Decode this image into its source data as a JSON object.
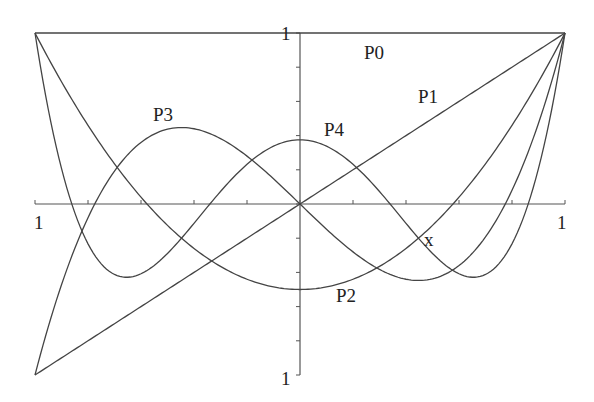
{
  "chart_data": {
    "type": "line",
    "title": "",
    "xlabel": "x",
    "ylabel": "",
    "xlim": [
      -1,
      1
    ],
    "ylim": [
      -1,
      1
    ],
    "grid": false,
    "legend": "inline labels",
    "x_tick_labels": [
      {
        "x": -1,
        "text": "1"
      },
      {
        "x": 1,
        "text": "1"
      }
    ],
    "y_tick_labels": [
      {
        "y": 1,
        "text": "1"
      },
      {
        "y": -1,
        "text": "1"
      }
    ],
    "x_ticks": [
      -1,
      -0.8,
      -0.6,
      -0.4,
      -0.2,
      0,
      0.2,
      0.4,
      0.6,
      0.8,
      1
    ],
    "y_ticks": [
      -1,
      -0.8,
      -0.6,
      -0.4,
      -0.2,
      0,
      0.2,
      0.4,
      0.6,
      0.8,
      1
    ],
    "x": [
      -1,
      -0.9,
      -0.8,
      -0.7,
      -0.6,
      -0.5,
      -0.4,
      -0.3,
      -0.2,
      -0.1,
      0,
      0.1,
      0.2,
      0.3,
      0.4,
      0.5,
      0.6,
      0.7,
      0.8,
      0.9,
      1
    ],
    "series": [
      {
        "name": "P0",
        "formula": "1",
        "values": [
          1,
          1,
          1,
          1,
          1,
          1,
          1,
          1,
          1,
          1,
          1,
          1,
          1,
          1,
          1,
          1,
          1,
          1,
          1,
          1,
          1
        ]
      },
      {
        "name": "P1",
        "formula": "x",
        "values": [
          -1,
          -0.9,
          -0.8,
          -0.7,
          -0.6,
          -0.5,
          -0.4,
          -0.3,
          -0.2,
          -0.1,
          0,
          0.1,
          0.2,
          0.3,
          0.4,
          0.5,
          0.6,
          0.7,
          0.8,
          0.9,
          1
        ]
      },
      {
        "name": "P2",
        "formula": "(3x^2-1)/2",
        "values": [
          1,
          0.715,
          0.46,
          0.235,
          0.04,
          -0.125,
          -0.26,
          -0.365,
          -0.44,
          -0.485,
          -0.5,
          -0.485,
          -0.44,
          -0.365,
          -0.26,
          -0.125,
          0.04,
          0.235,
          0.46,
          0.715,
          1
        ]
      },
      {
        "name": "P3",
        "formula": "(5x^3-3x)/2",
        "values": [
          -1,
          -0.4725,
          -0.08,
          0.1925,
          0.36,
          0.4375,
          0.44,
          0.3825,
          0.28,
          0.1475,
          0,
          -0.1475,
          -0.28,
          -0.3825,
          -0.44,
          -0.4375,
          -0.36,
          -0.1925,
          0.08,
          0.4725,
          1
        ]
      },
      {
        "name": "P4",
        "formula": "(35x^4-30x^2+3)/8",
        "values": [
          1,
          0.2079,
          -0.233,
          -0.4121,
          -0.408,
          -0.2891,
          -0.113,
          0.0729,
          0.232,
          0.3379,
          0.375,
          0.3379,
          0.232,
          0.0729,
          -0.113,
          -0.2891,
          -0.408,
          -0.4121,
          -0.233,
          0.2079,
          1
        ]
      }
    ],
    "annotations": [
      {
        "text": "P0",
        "x": 0.35,
        "y": 0.9
      },
      {
        "text": "P1",
        "x": 0.45,
        "y": 0.42
      },
      {
        "text": "P2",
        "x": 0.15,
        "y": -0.57
      },
      {
        "text": "P3",
        "x": -0.55,
        "y": 0.5
      },
      {
        "text": "P4",
        "x": 0.1,
        "y": 0.45
      },
      {
        "text": "x",
        "x": 0.43,
        "y": -0.23
      }
    ]
  },
  "labels": {
    "x_left": "1",
    "x_right": "1",
    "y_top": "1",
    "y_bottom": "1",
    "x_axis_name": "x",
    "p0": "P0",
    "p1": "P1",
    "p2": "P2",
    "p3": "P3",
    "p4": "P4"
  }
}
